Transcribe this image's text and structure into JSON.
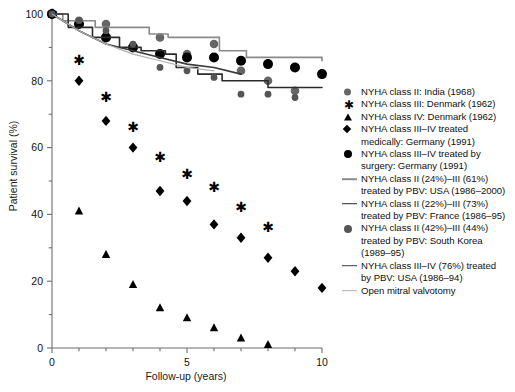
{
  "chart_data": {
    "type": "scatter",
    "title": "",
    "xlabel": "Follow-up (years)",
    "ylabel": "Patient survival (%)",
    "xlim": [
      0,
      10
    ],
    "ylim": [
      0,
      100
    ],
    "xticks": [
      0,
      5,
      10
    ],
    "xtick_labels": [
      "0",
      "5",
      "10"
    ],
    "xminor_ticks": [
      0,
      1,
      2,
      3,
      4,
      5,
      6,
      7,
      8,
      9,
      10
    ],
    "yticks": [
      0,
      20,
      40,
      60,
      80,
      100
    ],
    "ytick_labels": [
      "0",
      "20",
      "40",
      "60",
      "80",
      "100"
    ],
    "yminor_ticks": [
      0,
      10,
      20,
      30,
      40,
      50,
      60,
      70,
      80,
      90,
      100
    ],
    "grid": false,
    "legend_position": "right",
    "series": [
      {
        "name": "NYHA class II: India (1968)",
        "marker": "circle-gray",
        "color": "#666666",
        "style": "markers",
        "x": [
          0,
          1,
          2,
          4,
          5,
          6,
          7,
          8,
          9
        ],
        "y": [
          100,
          98,
          97,
          93,
          88,
          91,
          83,
          80,
          77
        ]
      },
      {
        "name": "NYHA class III: Denmark (1962)",
        "marker": "asterisk",
        "color": "#000000",
        "style": "markers",
        "x": [
          0,
          1,
          2,
          3,
          4,
          5,
          6,
          7,
          8
        ],
        "y": [
          100,
          86,
          75,
          66,
          57,
          52,
          48,
          42,
          36
        ]
      },
      {
        "name": "NYHA class IV: Denmark (1962)",
        "marker": "triangle",
        "color": "#000000",
        "style": "markers",
        "x": [
          0,
          1,
          2,
          3,
          4,
          5,
          6,
          7,
          8
        ],
        "y": [
          100,
          41,
          28,
          19,
          12,
          9,
          6,
          3,
          1
        ]
      },
      {
        "name": "NYHA class III–IV treated medically: Germany (1991)",
        "marker": "diamond",
        "color": "#000000",
        "style": "markers",
        "x": [
          0,
          1,
          2,
          3,
          4,
          5,
          6,
          7,
          8,
          9,
          10
        ],
        "y": [
          100,
          80,
          68,
          60,
          47,
          44,
          37,
          33,
          27,
          23,
          18
        ]
      },
      {
        "name": "NYHA class III–IV treated by surgery: Germany (1991)",
        "marker": "circle-black",
        "color": "#000000",
        "style": "markers",
        "x": [
          0,
          1,
          2,
          3,
          4,
          5,
          6,
          7,
          8,
          9,
          10
        ],
        "y": [
          100,
          97,
          93,
          90,
          88,
          87,
          87,
          86,
          85,
          84,
          82
        ]
      },
      {
        "name": "NYHA class II (24%)–III (61%) treated by PBV: USA (1986–2000)",
        "marker": "line-gray",
        "color": "#8a8a8a",
        "style": "step-line",
        "x": [
          0,
          0.4,
          1.6,
          2.6,
          3.6,
          4.3,
          5.6,
          6.2,
          7.2,
          8.1,
          9.2,
          10
        ],
        "y": [
          100,
          98,
          96,
          96,
          94,
          93,
          93,
          89,
          87,
          87,
          87,
          86
        ]
      },
      {
        "name": "NYHA class II (22%)–III (73%) treated by PBV: France (1986–95)",
        "marker": "line-dark",
        "color": "#2b2b2b",
        "style": "step-line",
        "x": [
          0,
          0.6,
          1.5,
          2.5,
          3.3,
          4.2,
          4.6,
          5.4,
          6.3,
          7.0,
          8.0,
          9.2,
          10
        ],
        "y": [
          100,
          96,
          93,
          90,
          89,
          88,
          84,
          82,
          80,
          80,
          78,
          78,
          78
        ]
      },
      {
        "name": "NYHA class II (42%)–III (44%) treated by PBV: South Korea (1989–95)",
        "marker": "circle-smallgray",
        "color": "#555555",
        "style": "markers",
        "x": [
          0,
          1,
          2,
          3,
          4,
          5,
          6,
          7,
          8,
          9
        ],
        "y": [
          100,
          98,
          95,
          91,
          84,
          83,
          81,
          76,
          76,
          75
        ]
      },
      {
        "name": "NYHA class III–IV (76%) treated by PBV: USA (1986–94)",
        "marker": "line-dark2",
        "color": "#3a3a3a",
        "style": "line",
        "x": [
          0,
          1,
          2,
          3,
          4,
          5,
          6,
          7
        ],
        "y": [
          100,
          95,
          91,
          89,
          87,
          85,
          84,
          82
        ]
      },
      {
        "name": "Open mitral valvotomy",
        "marker": "line-lightgray",
        "color": "#b0b0b0",
        "style": "line",
        "x": [
          0,
          1,
          2,
          3,
          4,
          5,
          6
        ],
        "y": [
          100,
          95,
          91,
          88,
          86,
          84,
          83
        ]
      }
    ]
  },
  "axes": {
    "xlabel": "Follow-up (years)",
    "ylabel": "Patient survival (%)",
    "xtick_labels": [
      "0",
      "5",
      "10"
    ],
    "ytick_labels": [
      "0",
      "20",
      "40",
      "60",
      "80",
      "100"
    ]
  },
  "legend": {
    "entries": [
      {
        "marker": "circle-gray",
        "line1": "NYHA class II: India (1968)",
        "line2": "",
        "line3": ""
      },
      {
        "marker": "asterisk",
        "line1": "NYHA class III: Denmark (1962)",
        "line2": "",
        "line3": ""
      },
      {
        "marker": "triangle",
        "line1": "NYHA class IV: Denmark (1962)",
        "line2": "",
        "line3": ""
      },
      {
        "marker": "diamond",
        "line1": "NYHA class III–IV treated",
        "line2": "medically: Germany (1991)",
        "line3": ""
      },
      {
        "marker": "circle-black",
        "line1": "NYHA class III–IV treated by",
        "line2": "surgery: Germany (1991)",
        "line3": ""
      },
      {
        "marker": "line-gray",
        "line1": "NYHA class II (24%)–III (61%)",
        "line2": "treated by PBV: USA (1986–2000)",
        "line3": ""
      },
      {
        "marker": "line-dark",
        "line1": "NYHA class II (22%)–III (73%)",
        "line2": "treated by PBV: France (1986–95)",
        "line3": ""
      },
      {
        "marker": "circle-smallgray",
        "line1": "NYHA class II (42%)–III (44%)",
        "line2": "treated by PBV: South Korea",
        "line3": "(1989–95)"
      },
      {
        "marker": "line-dark2",
        "line1": "NYHA class III–IV (76%) treated",
        "line2": "by PBV: USA (1986–94)",
        "line3": ""
      },
      {
        "marker": "line-lightgray",
        "line1": "Open mitral valvotomy",
        "line2": "",
        "line3": ""
      }
    ]
  },
  "colors": {
    "axis": "#6e6e6e",
    "text": "#111111",
    "gray_marker": "#666666",
    "black_marker": "#000000",
    "line_gray": "#8a8a8a",
    "line_dark": "#2b2b2b",
    "line_light": "#b0b0b0",
    "background": "#ffffff"
  }
}
